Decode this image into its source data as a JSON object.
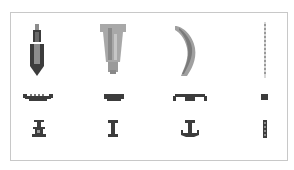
{
  "panel": {
    "title": "",
    "border_color": "#c8c8c8",
    "background": "#ffffff"
  },
  "columns": [
    {
      "id": "col-1",
      "top_icon": "pencil-tip-icon",
      "middle_icon": "crown-platform-icon",
      "bottom_icon": "spool-icon",
      "colors": {
        "primary": "#3c3c3c",
        "fill": "#8c8c8c"
      }
    },
    {
      "id": "col-2",
      "top_icon": "tapered-plug-icon",
      "middle_icon": "flat-bar-icon",
      "bottom_icon": "i-beam-icon",
      "colors": {
        "primary": "#3c3c3c",
        "fill": "#a8a8a8"
      }
    },
    {
      "id": "col-3",
      "top_icon": "crescent-icon",
      "middle_icon": "wide-bracket-icon",
      "bottom_icon": "anchor-icon",
      "colors": {
        "primary": "#3c3c3c",
        "fill": "#a0a0a0"
      }
    },
    {
      "id": "col-4",
      "top_icon": "thin-dotted-line-icon",
      "middle_icon": "small-square-icon",
      "bottom_icon": "dotted-bar-icon",
      "colors": {
        "primary": "#3c3c3c",
        "fill": "#c0c0c0"
      }
    }
  ]
}
